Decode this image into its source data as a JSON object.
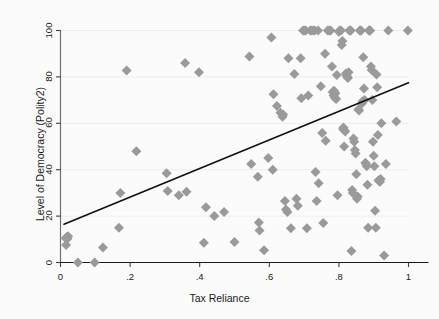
{
  "chart_data": {
    "type": "scatter",
    "title": "",
    "xlabel": "Tax Reliance",
    "ylabel": "Level of Democracy (Polity2)",
    "xlim": [
      0,
      1
    ],
    "ylim": [
      0,
      100
    ],
    "xticks": [
      0,
      0.2,
      0.4,
      0.6,
      0.8,
      1
    ],
    "xticklabels": [
      "0",
      ".2",
      ".4",
      ".6",
      ".8",
      "1"
    ],
    "yticks": [
      0,
      20,
      40,
      60,
      80,
      100
    ],
    "yticklabels": [
      "0",
      "20",
      "40",
      "60",
      "80",
      "100"
    ],
    "grid": "horizontal-faint",
    "legend": "none",
    "marker": {
      "shape": "diamond",
      "color": "#9a9a9a",
      "size": 5
    },
    "fit_line": {
      "type": "linear",
      "color": "#111111",
      "width": 1.6,
      "x0": 0.01,
      "y0": 16.5,
      "x1": 1.0,
      "y1": 77.5
    },
    "points": [
      [
        0.015,
        10.5
      ],
      [
        0.018,
        11.0
      ],
      [
        0.02,
        10.2
      ],
      [
        0.022,
        11.3
      ],
      [
        0.016,
        7.5
      ],
      [
        0.05,
        0.0
      ],
      [
        0.098,
        0.0
      ],
      [
        0.122,
        6.5
      ],
      [
        0.168,
        15.0
      ],
      [
        0.172,
        30.0
      ],
      [
        0.19,
        82.8
      ],
      [
        0.218,
        48.0
      ],
      [
        0.305,
        38.5
      ],
      [
        0.308,
        30.8
      ],
      [
        0.34,
        29.0
      ],
      [
        0.358,
        86.0
      ],
      [
        0.362,
        30.5
      ],
      [
        0.398,
        82.0
      ],
      [
        0.412,
        8.5
      ],
      [
        0.418,
        23.8
      ],
      [
        0.442,
        20.0
      ],
      [
        0.47,
        21.8
      ],
      [
        0.5,
        8.8
      ],
      [
        0.543,
        88.8
      ],
      [
        0.548,
        42.5
      ],
      [
        0.567,
        37.0
      ],
      [
        0.57,
        17.2
      ],
      [
        0.572,
        13.8
      ],
      [
        0.585,
        5.3
      ],
      [
        0.597,
        45.0
      ],
      [
        0.606,
        97.0
      ],
      [
        0.61,
        40.0
      ],
      [
        0.612,
        72.5
      ],
      [
        0.622,
        67.5
      ],
      [
        0.632,
        64.5
      ],
      [
        0.638,
        62.8
      ],
      [
        0.64,
        63.8
      ],
      [
        0.645,
        26.5
      ],
      [
        0.648,
        22.8
      ],
      [
        0.652,
        21.8
      ],
      [
        0.655,
        88.0
      ],
      [
        0.662,
        14.8
      ],
      [
        0.672,
        81.2
      ],
      [
        0.678,
        27.5
      ],
      [
        0.682,
        24.5
      ],
      [
        0.69,
        88.0
      ],
      [
        0.692,
        70.8
      ],
      [
        0.697,
        100.0
      ],
      [
        0.7,
        100.0
      ],
      [
        0.705,
        100.0
      ],
      [
        0.708,
        14.8
      ],
      [
        0.712,
        72.0
      ],
      [
        0.718,
        100.0
      ],
      [
        0.722,
        100.0
      ],
      [
        0.726,
        100.0
      ],
      [
        0.73,
        100.0
      ],
      [
        0.733,
        39.0
      ],
      [
        0.736,
        26.5
      ],
      [
        0.74,
        100.0
      ],
      [
        0.742,
        34.2
      ],
      [
        0.748,
        76.0
      ],
      [
        0.752,
        55.8
      ],
      [
        0.755,
        17.0
      ],
      [
        0.76,
        90.0
      ],
      [
        0.762,
        52.5
      ],
      [
        0.768,
        100.0
      ],
      [
        0.772,
        100.0
      ],
      [
        0.776,
        100.0
      ],
      [
        0.78,
        84.5
      ],
      [
        0.782,
        73.5
      ],
      [
        0.785,
        72.0
      ],
      [
        0.786,
        74.0
      ],
      [
        0.788,
        71.0
      ],
      [
        0.79,
        73.0
      ],
      [
        0.792,
        70.5
      ],
      [
        0.794,
        80.8
      ],
      [
        0.796,
        29.0
      ],
      [
        0.8,
        99.5
      ],
      [
        0.802,
        100.0
      ],
      [
        0.806,
        100.0
      ],
      [
        0.808,
        93.8
      ],
      [
        0.81,
        95.5
      ],
      [
        0.812,
        57.5
      ],
      [
        0.813,
        58.2
      ],
      [
        0.815,
        50.0
      ],
      [
        0.816,
        57.0
      ],
      [
        0.818,
        56.5
      ],
      [
        0.82,
        81.5
      ],
      [
        0.822,
        80.5
      ],
      [
        0.824,
        80.0
      ],
      [
        0.826,
        79.5
      ],
      [
        0.828,
        82.0
      ],
      [
        0.83,
        100.0
      ],
      [
        0.832,
        100.0
      ],
      [
        0.834,
        100.0
      ],
      [
        0.836,
        5.0
      ],
      [
        0.838,
        31.2
      ],
      [
        0.84,
        30.0
      ],
      [
        0.842,
        53.5
      ],
      [
        0.844,
        52.0
      ],
      [
        0.846,
        48.5
      ],
      [
        0.848,
        47.0
      ],
      [
        0.85,
        38.0
      ],
      [
        0.852,
        27.5
      ],
      [
        0.854,
        28.5
      ],
      [
        0.856,
        66.0
      ],
      [
        0.858,
        65.5
      ],
      [
        0.86,
        100.0
      ],
      [
        0.862,
        100.0
      ],
      [
        0.864,
        100.0
      ],
      [
        0.866,
        68.5
      ],
      [
        0.868,
        69.5
      ],
      [
        0.87,
        88.5
      ],
      [
        0.872,
        75.0
      ],
      [
        0.874,
        70.0
      ],
      [
        0.876,
        43.0
      ],
      [
        0.878,
        42.5
      ],
      [
        0.88,
        41.5
      ],
      [
        0.882,
        33.5
      ],
      [
        0.884,
        15.0
      ],
      [
        0.886,
        100.0
      ],
      [
        0.888,
        100.0
      ],
      [
        0.89,
        100.0
      ],
      [
        0.892,
        84.5
      ],
      [
        0.894,
        83.0
      ],
      [
        0.896,
        70.0
      ],
      [
        0.898,
        52.0
      ],
      [
        0.9,
        46.0
      ],
      [
        0.902,
        41.5
      ],
      [
        0.904,
        22.3
      ],
      [
        0.906,
        15.0
      ],
      [
        0.908,
        81.0
      ],
      [
        0.91,
        75.5
      ],
      [
        0.912,
        55.0
      ],
      [
        0.914,
        35.5
      ],
      [
        0.916,
        35.0
      ],
      [
        0.918,
        34.8
      ],
      [
        0.92,
        36.0
      ],
      [
        0.922,
        60.0
      ],
      [
        0.93,
        3.0
      ],
      [
        0.935,
        42.5
      ],
      [
        0.942,
        100.0
      ],
      [
        0.965,
        60.8
      ],
      [
        0.998,
        100.0
      ]
    ]
  },
  "axis_titles": {
    "x": "Tax Reliance",
    "y": "Level of Democracy (Polity2)"
  }
}
